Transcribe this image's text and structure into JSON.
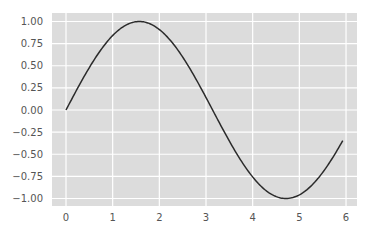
{
  "chart_data": {
    "type": "line",
    "title": "",
    "xlabel": "",
    "ylabel": "",
    "style": {
      "background": "#dcdcdc",
      "grid_color": "#ffffff",
      "line_color": "#2b2b2b",
      "tick_label_color": "#555555"
    },
    "grid": true,
    "legend": null,
    "xlim": [
      -0.3,
      6.2
    ],
    "ylim": [
      -1.1,
      1.1
    ],
    "x_ticks": [
      0,
      1,
      2,
      3,
      4,
      5,
      6
    ],
    "x_tick_labels": [
      "0",
      "1",
      "2",
      "3",
      "4",
      "5",
      "6"
    ],
    "y_ticks": [
      1.0,
      0.75,
      0.5,
      0.25,
      0.0,
      -0.25,
      -0.5,
      -0.75,
      -1.0
    ],
    "y_tick_labels": [
      "1.00",
      "0.75",
      "0.50",
      "0.25",
      "0.00",
      "−0.25",
      "−0.50",
      "−0.75",
      "−1.00"
    ],
    "series": [
      {
        "name": "sin(x)",
        "function": "sin",
        "x_range": [
          0,
          5.93
        ],
        "x": [
          0,
          0.25,
          0.5,
          0.75,
          1.0,
          1.25,
          1.5,
          1.57,
          1.75,
          2.0,
          2.25,
          2.5,
          2.75,
          3.0,
          3.14,
          3.25,
          3.5,
          3.75,
          4.0,
          4.25,
          4.5,
          4.71,
          5.0,
          5.25,
          5.5,
          5.75,
          5.93
        ],
        "y": [
          0.0,
          0.247,
          0.479,
          0.682,
          0.841,
          0.949,
          0.997,
          1.0,
          0.984,
          0.909,
          0.778,
          0.598,
          0.382,
          0.141,
          0.0,
          -0.108,
          -0.351,
          -0.572,
          -0.757,
          -0.895,
          -0.978,
          -1.0,
          -0.959,
          -0.859,
          -0.706,
          -0.508,
          -0.352
        ]
      }
    ]
  }
}
